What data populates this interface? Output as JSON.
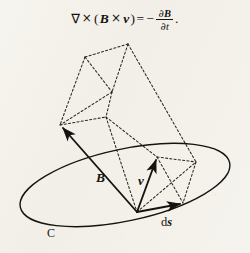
{
  "figure": {
    "caption_equation": {
      "nabla": "∇",
      "cross1": "×",
      "open_paren": "(",
      "vector_B": "B",
      "cross2": "×",
      "vector_v": "v",
      "close_paren": ")",
      "equals": "=",
      "minus": "−",
      "fraction_numerator_partial": "∂",
      "fraction_numerator_vector": "B",
      "fraction_denominator_partial": "∂",
      "fraction_denominator_var": "t",
      "period": ".",
      "plain_text": "∇ × (B × v) = − ∂B/∂t."
    },
    "labels": {
      "magnetic_field": "B",
      "velocity": "v",
      "line_element_d": "d",
      "line_element_s": "s",
      "contour": "C"
    },
    "colors": {
      "ink": "#15130f",
      "paper": "#f4f2ec",
      "dashed_ink": "#3a362f"
    },
    "geometry": {
      "contour_ellipse": {
        "center_x": 125,
        "center_y": 185,
        "radius_x": 107,
        "radius_y": 36,
        "rotation_deg": -12
      },
      "origin_point": {
        "x": 137,
        "y": 212
      },
      "vector_B_tip": {
        "x": 60,
        "y": 125
      },
      "vector_v_tip": {
        "x": 157,
        "y": 157
      },
      "vector_ds_tip": {
        "x": 183,
        "y": 203
      },
      "prism_vertices": {
        "top_apex": {
          "x": 128,
          "y": 44
        },
        "top_left": {
          "x": 85,
          "y": 57
        },
        "mid_left": {
          "x": 60,
          "y": 125
        },
        "mid_center": {
          "x": 106,
          "y": 117
        },
        "inner_cross": {
          "x": 112,
          "y": 92
        },
        "right_lower": {
          "x": 196,
          "y": 162
        },
        "right_mid": {
          "x": 157,
          "y": 157
        },
        "bottom_right": {
          "x": 183,
          "y": 203
        }
      }
    }
  }
}
